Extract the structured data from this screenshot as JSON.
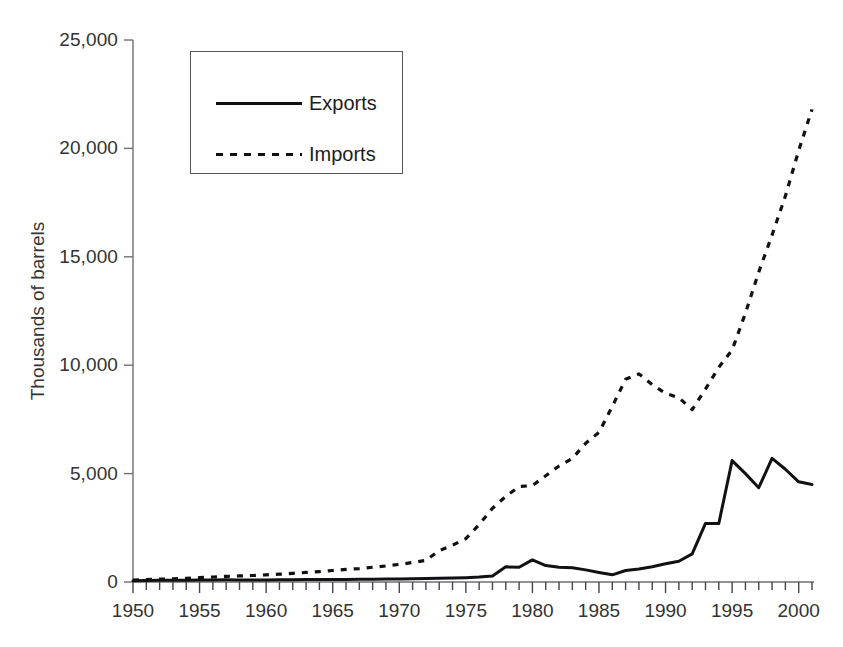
{
  "chart_data": {
    "type": "line",
    "title": "",
    "xlabel": "",
    "ylabel": "Thousands of barrels",
    "xlim": [
      1950,
      2001
    ],
    "ylim": [
      0,
      25000
    ],
    "grid": false,
    "legend_position": "upper-left-inside",
    "y_ticks": [
      0,
      5000,
      10000,
      15000,
      20000,
      25000
    ],
    "y_tick_labels": [
      "0",
      "5,000",
      "10,000",
      "15,000",
      "20,000",
      "25,000"
    ],
    "x_ticks": [
      1950,
      1955,
      1960,
      1965,
      1970,
      1975,
      1980,
      1985,
      1990,
      1995,
      2000
    ],
    "x_tick_labels": [
      "1950",
      "1955",
      "1960",
      "1965",
      "1970",
      "1975",
      "1980",
      "1985",
      "1990",
      "1995",
      "2000"
    ],
    "x_minor_tick_interval": 1,
    "x": [
      1950,
      1951,
      1952,
      1953,
      1954,
      1955,
      1956,
      1957,
      1958,
      1959,
      1960,
      1961,
      1962,
      1963,
      1964,
      1965,
      1966,
      1967,
      1968,
      1969,
      1970,
      1971,
      1972,
      1973,
      1974,
      1975,
      1976,
      1977,
      1978,
      1979,
      1980,
      1981,
      1982,
      1983,
      1984,
      1985,
      1986,
      1987,
      1988,
      1989,
      1990,
      1991,
      1992,
      1993,
      1994,
      1995,
      1996,
      1997,
      1998,
      1999,
      2000,
      2001
    ],
    "series": [
      {
        "name": "Exports",
        "style": "solid",
        "color": "#111111",
        "values": [
          60,
          70,
          75,
          80,
          85,
          90,
          95,
          100,
          95,
          90,
          95,
          100,
          105,
          110,
          110,
          115,
          120,
          125,
          130,
          135,
          140,
          150,
          160,
          170,
          180,
          200,
          230,
          280,
          700,
          680,
          1020,
          760,
          680,
          660,
          560,
          440,
          330,
          530,
          600,
          700,
          840,
          960,
          1300,
          2700,
          2700,
          5600,
          5000,
          4350,
          5700,
          5200,
          4620,
          4500
        ]
      },
      {
        "name": "Imports",
        "style": "dashed",
        "color": "#111111",
        "values": [
          90,
          110,
          130,
          150,
          170,
          200,
          230,
          260,
          280,
          300,
          330,
          360,
          400,
          440,
          480,
          530,
          580,
          620,
          680,
          740,
          810,
          900,
          1000,
          1450,
          1700,
          2000,
          2650,
          3400,
          3950,
          4400,
          4450,
          4900,
          5350,
          5700,
          6400,
          6900,
          8100,
          9350,
          9600,
          9100,
          8700,
          8500,
          7950,
          8900,
          9900,
          10700,
          12400,
          14300,
          16000,
          17800,
          19900,
          21800
        ]
      }
    ]
  },
  "legend": {
    "items": [
      {
        "label": "Exports",
        "style": "solid"
      },
      {
        "label": "Imports",
        "style": "dashed"
      }
    ]
  }
}
